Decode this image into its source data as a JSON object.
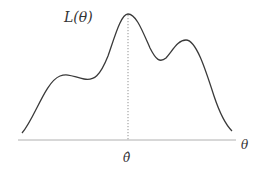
{
  "diagram": {
    "ylabel": "L(θ)",
    "xlabel": "θ",
    "marker_label": "θ̂",
    "colors": {
      "curve": "#3a3a3a",
      "axis": "#b0b0b0",
      "marker_line": "#777777",
      "text": "#333333"
    }
  }
}
